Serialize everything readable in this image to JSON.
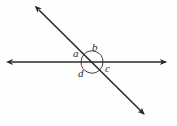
{
  "figure": {
    "type": "geometry-diagram",
    "background_color": "#fefefe",
    "stroke_color": "#2b2b2b",
    "canvas": {
      "width": 177,
      "height": 126
    },
    "intersection_point": {
      "x": 92,
      "y": 62
    },
    "lines": [
      {
        "name": "horizontal-line",
        "double_headed": true,
        "start": {
          "x": 10,
          "y": 62
        },
        "end": {
          "x": 168,
          "y": 62
        }
      },
      {
        "name": "diagonal-line",
        "double_headed": true,
        "start": {
          "x": 37,
          "y": 8
        },
        "end": {
          "x": 146,
          "y": 116
        }
      }
    ],
    "angle_arcs": [
      {
        "name": "arc-a",
        "cx": 92,
        "cy": 62,
        "r": 11,
        "start_deg": 180,
        "end_deg": 135
      },
      {
        "name": "arc-b",
        "cx": 92,
        "cy": 62,
        "r": 11,
        "start_deg": 135,
        "end_deg": 0
      },
      {
        "name": "arc-c",
        "cx": 92,
        "cy": 62,
        "r": 11,
        "start_deg": 0,
        "end_deg": -45
      },
      {
        "name": "arc-d",
        "cx": 92,
        "cy": 62,
        "r": 11,
        "start_deg": -45,
        "end_deg": -180
      }
    ],
    "labels": {
      "a": "a",
      "b": "b",
      "c": "c",
      "d": "d"
    }
  }
}
